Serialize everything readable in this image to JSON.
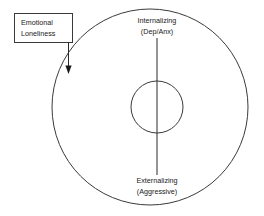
{
  "diagram": {
    "annotation_box": {
      "line1": "Emotional",
      "line2": "Loneliness"
    },
    "axis_top": {
      "line1": "Internalizing",
      "line2": "(Dep/Anx)"
    },
    "axis_bottom": {
      "line1": "Externalizing",
      "line2": "(Aggressive)"
    },
    "colors": {
      "stroke": "#3a3a3a",
      "text": "#1a1a1a",
      "background": "#ffffff",
      "arrow": "#1a1a1a"
    }
  }
}
